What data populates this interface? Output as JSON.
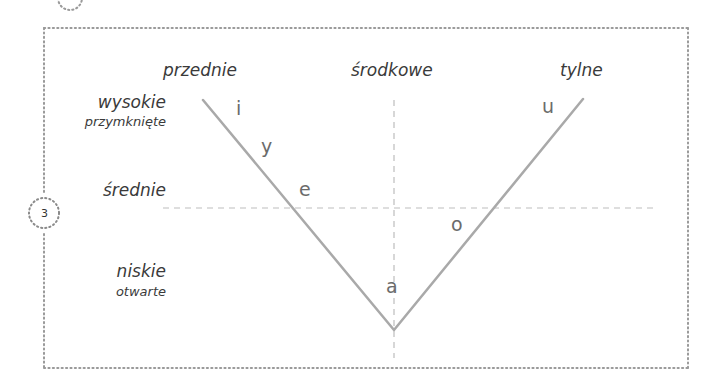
{
  "diagram": {
    "type": "vowel-trapezoid",
    "step_badge": "3",
    "columns": {
      "front": "przednie",
      "central": "środkowe",
      "back": "tylne"
    },
    "rows": {
      "high": {
        "label": "wysokie",
        "sublabel": "przymknięte"
      },
      "mid": {
        "label": "średnie"
      },
      "low": {
        "label": "niskie",
        "sublabel": "otwarte"
      }
    },
    "vowels": {
      "i": "i",
      "y": "y",
      "e": "e",
      "a": "a",
      "o": "o",
      "u": "u"
    },
    "colors": {
      "line": "#a9a9a9",
      "dashed": "#bdbdbd",
      "border_dots": "#9a9a9a",
      "label_text": "#3a3a3a",
      "vowel_text": "#6b6b6b"
    }
  }
}
